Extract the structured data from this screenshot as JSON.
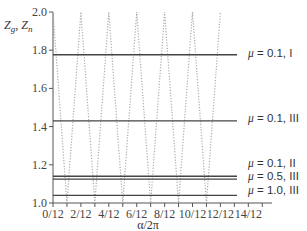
{
  "chart_data": {
    "type": "line",
    "title": "",
    "xlabel": "α/2π",
    "ylabel": "Z_g, Z_n",
    "xlim": [
      0,
      14
    ],
    "ylim": [
      1.0,
      2.0
    ],
    "x_ticks": [
      "0/12",
      "2/12",
      "4/12",
      "6/12",
      "8/12",
      "10/12",
      "12/12",
      "14/12"
    ],
    "y_ticks": [
      "1.0",
      "1.2",
      "1.4",
      "1.6",
      "1.8",
      "2.0"
    ],
    "grid": false,
    "series": [
      {
        "name": "μ = 0.1, I",
        "style": "solid",
        "y": 1.776,
        "x_range": [
          0,
          15.3
        ]
      },
      {
        "name": "μ = 0.1, III",
        "style": "solid",
        "y": 1.43,
        "x_range": [
          0,
          15.3
        ]
      },
      {
        "name": "μ = 0.1, II",
        "style": "solid",
        "y": 1.14,
        "x_range": [
          0,
          15.3
        ]
      },
      {
        "name": "μ = 0.5, III",
        "style": "solid",
        "y": 1.125,
        "x_range": [
          0,
          15.3
        ]
      },
      {
        "name": "μ = 1.0, III",
        "style": "solid",
        "y": 1.04,
        "x_range": [
          0,
          15.3
        ]
      },
      {
        "name": "zigzag",
        "style": "dotted",
        "x": [
          0,
          1,
          2,
          3,
          4,
          5,
          6,
          7,
          8,
          9,
          10,
          11,
          12
        ],
        "values": [
          2.0,
          1.0,
          2.0,
          1.0,
          2.0,
          1.0,
          2.0,
          1.0,
          2.0,
          1.0,
          2.0,
          1.0,
          2.0
        ]
      }
    ],
    "legend_position": "right, inline labels"
  },
  "labels": {
    "ylabel_main": "Z",
    "ylabel_sub1": "g",
    "ylabel_sep": ", Z",
    "ylabel_sub2": "n",
    "xlabel": "α/2π"
  }
}
